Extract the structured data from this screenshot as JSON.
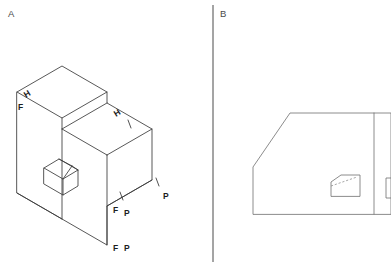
{
  "figure": {
    "background_color": "#ffffff",
    "line_color": "#3a3a3a",
    "hidden_line_color": "#8a8a8a",
    "width": 391,
    "height": 267
  },
  "panels": [
    {
      "id": "panel-a",
      "letter": "A",
      "type": "isometric-pictorial",
      "description": "Isometric view of an L-shaped block with a sloped chamfer face and a small raised boss with a sloped top on the base"
    },
    {
      "id": "panel-b",
      "letter": "B",
      "type": "orthographic-front-view",
      "description": "Orthographic front view outline with a chamfered upper-left corner and a small inner pocket with a chamfered corner and hidden line"
    }
  ],
  "divider": {
    "name": "panel-divider",
    "orientation": "vertical",
    "x": 213,
    "y_top": 5,
    "y_bottom": 262
  },
  "annotations": {
    "panel_a_marks": [
      {
        "id": "mark-h-top-left",
        "text": "H",
        "x": 26,
        "y": 98,
        "rotation": -32
      },
      {
        "id": "mark-f-top-left",
        "text": "F",
        "x": 18,
        "y": 110,
        "rotation": 0
      },
      {
        "id": "mark-h-upper-right",
        "text": "H",
        "x": 116,
        "y": 117,
        "rotation": -32
      },
      {
        "id": "mark-p-right",
        "text": "P",
        "x": 163,
        "y": 199,
        "rotation": 0
      },
      {
        "id": "mark-f-mid-bottom",
        "text": "F",
        "x": 113,
        "y": 213,
        "rotation": 0
      },
      {
        "id": "mark-p-mid-bottom",
        "text": "P",
        "x": 124,
        "y": 216,
        "rotation": 0
      },
      {
        "id": "mark-f-low-bottom",
        "text": "F",
        "x": 113,
        "y": 251,
        "rotation": 0
      },
      {
        "id": "mark-p-low-bottom",
        "text": "P",
        "x": 124,
        "y": 251,
        "rotation": 0
      }
    ],
    "panel_a_ticks": [
      {
        "id": "tick-upper-right",
        "x1": 128,
        "y1": 120,
        "x2": 131,
        "y2": 128
      },
      {
        "id": "tick-right-lower",
        "x1": 156,
        "y1": 178,
        "x2": 159,
        "y2": 186
      },
      {
        "id": "tick-mid-bottom",
        "x1": 120,
        "y1": 192,
        "x2": 123,
        "y2": 200
      }
    ]
  },
  "geometry": {
    "panel_a": {
      "outline": "M 17,92 L 62,66 L 107,92 L 107,103 L 152,129 L 152,180 L 107,206 L 107,245 L 62,219 L 17,193 Z",
      "edges": [
        "M 17,92 L 62,118 L 107,92",
        "M 62,118 L 62,219",
        "M 107,103 L 62,129",
        "M 62,129 L 107,155",
        "M 107,155 L 152,129",
        "M 107,155 L 107,245",
        "M 107,206 L 152,180",
        "M 17,193 L 62,219"
      ],
      "boss": [
        "M 44,168 L 59,159 L 78,170 L 78,186 L 63,195 L 44,184 Z",
        "M 44,168 L 63,179 L 78,170",
        "M 63,179 L 63,195",
        "M 59,159 L 72,166",
        "M 72,166 L 78,170",
        "M 63,179 L 72,166",
        "M 44,168 L 59,159"
      ]
    },
    "panel_b": {
      "outline": "M 253,214 L 253,167 L 290,113 L 391,113 L 391,214 Z",
      "divider_inner": "M 374,113 L 374,214",
      "pocket": "M 331,196 L 331,182 L 341,175 L 360,175 L 360,196 Z",
      "pocket_hidden": "M 331,186 L 357,177",
      "right_fragment": "M 386,178 L 391,178 M 386,178 L 386,198 M 386,198 L 391,198"
    }
  }
}
